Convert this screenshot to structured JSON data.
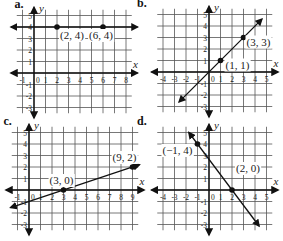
{
  "panels": [
    {
      "id": "a",
      "letter": "a.",
      "origin_px": [
        34,
        73
      ],
      "unit_px": 11.5,
      "x_range": [
        -1,
        8
      ],
      "y_range": [
        -3,
        5
      ],
      "x_label": "x",
      "y_label": "y",
      "x_ticks": [
        "-1",
        "0",
        "1",
        "2",
        "3",
        "4",
        "5",
        "6",
        "7",
        "8"
      ],
      "y_ticks": [
        "5",
        "4",
        "3",
        "2",
        "1",
        "-1",
        "-2",
        "-3"
      ],
      "points": [
        {
          "x": 2,
          "y": 4,
          "label": "(2, 4)"
        },
        {
          "x": 6,
          "y": 4,
          "label": "(6, 4)"
        }
      ],
      "line": {
        "type": "horizontal",
        "y": 4,
        "description": "horizontal line y = 4"
      }
    },
    {
      "id": "b",
      "letter": "b.",
      "origin_px": [
        209,
        72
      ],
      "unit_px": 11.5,
      "x_range": [
        -4,
        5
      ],
      "y_range": [
        -3,
        5
      ],
      "x_label": "x",
      "y_label": "y",
      "x_ticks": [
        "-4",
        "-3",
        "-2",
        "-1",
        "0",
        "1",
        "2",
        "3",
        "4",
        "5"
      ],
      "y_ticks": [
        "5",
        "4",
        "3",
        "2",
        "1",
        "-1",
        "-2",
        "-3"
      ],
      "points": [
        {
          "x": 1,
          "y": 1,
          "label": "(1, 1)"
        },
        {
          "x": 3,
          "y": 3,
          "label": "(3, 3)"
        }
      ],
      "line": {
        "type": "sloped",
        "from": [
          -2.6,
          -2.6
        ],
        "to": [
          4.6,
          4.6
        ],
        "description": "line y = x"
      }
    },
    {
      "id": "c",
      "letter": "c.",
      "origin_px": [
        29,
        190
      ],
      "unit_px": 11.5,
      "x_range": [
        -1,
        9
      ],
      "y_range": [
        -3,
        5
      ],
      "x_label": "x",
      "y_label": "y",
      "x_ticks": [
        "-1",
        "0",
        "1",
        "2",
        "3",
        "4",
        "5",
        "6",
        "7",
        "8",
        "9"
      ],
      "y_ticks": [
        "5",
        "4",
        "3",
        "2",
        "1",
        "-1",
        "-2",
        "-3"
      ],
      "points": [
        {
          "x": 3,
          "y": 0,
          "label": "(3, 0)"
        },
        {
          "x": 9,
          "y": 2,
          "label": "(9, 2)"
        }
      ],
      "line": {
        "type": "sloped",
        "from": [
          -1.6,
          -1.53
        ],
        "to": [
          9.6,
          2.2
        ],
        "description": "line y = (1/3)x - 1"
      }
    },
    {
      "id": "d",
      "letter": "d.",
      "origin_px": [
        209,
        190
      ],
      "unit_px": 11.5,
      "x_range": [
        -4,
        5
      ],
      "y_range": [
        -3,
        5
      ],
      "x_label": "x",
      "y_label": "y",
      "x_ticks": [
        "-4",
        "-3",
        "-2",
        "-1",
        "0",
        "1",
        "2",
        "3",
        "4",
        "5"
      ],
      "y_ticks": [
        "5",
        "4",
        "3",
        "2",
        "1",
        "-1",
        "-2",
        "-3"
      ],
      "points": [
        {
          "x": -1,
          "y": 4,
          "label": "(−1, 4)"
        },
        {
          "x": 2,
          "y": 0,
          "label": "(2, 0)"
        }
      ],
      "line": {
        "type": "sloped",
        "from": [
          -1.75,
          5.0
        ],
        "to": [
          4.35,
          -3.13
        ],
        "description": "line y = -(4/3)x + 8/3"
      }
    }
  ]
}
